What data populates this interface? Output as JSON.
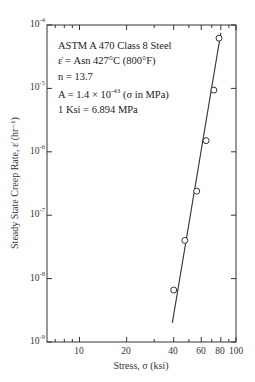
{
  "chart_data": {
    "type": "scatter",
    "title": "",
    "xlabel": "Stress, σ (ksi)",
    "ylabel": "Steady State Creep Rate, ε̇ (hr⁻¹)",
    "xscale": "log",
    "yscale": "log",
    "xlim": [
      6.2,
      100
    ],
    "ylim": [
      1e-09,
      0.0001
    ],
    "x_ticks": [
      "10",
      "20",
      "40",
      "60",
      "80",
      "100"
    ],
    "y_ticks": [
      "10-4",
      "10-5",
      "10-6",
      "10-7",
      "10-8",
      "10-9"
    ],
    "grid": false,
    "series": [
      {
        "name": "Measured",
        "marker": "open-circle",
        "x": [
          40.0,
          47.1,
          56.1,
          64.4,
          72.2,
          77.9
        ],
        "y": [
          6.6e-09,
          4e-08,
          2.4e-07,
          1.5e-06,
          9.4e-06,
          6.2e-05
        ]
      },
      {
        "name": "Power-law fit",
        "style": "line",
        "x": [
          39.2,
          80.0
        ],
        "y": [
          2e-09,
          7.5e-05
        ]
      }
    ],
    "annotations": [
      "ASTM A 470 Class 8 Steel",
      "ε̇ = Asn   427°C (800°F)",
      "n = 13.7",
      "A = 1.4 × 10^-43 (σ in MPa)",
      "1 Ksi = 6.894 MPa"
    ]
  },
  "labels": {
    "x_title": "Stress, σ (ksi)",
    "y_title": "Steady State Creep Rate, ε̇ (hr⁻¹)",
    "y_ticks": [
      {
        "base": "10",
        "exp": "-4"
      },
      {
        "base": "10",
        "exp": "-5"
      },
      {
        "base": "10",
        "exp": "-6"
      },
      {
        "base": "10",
        "exp": "-7"
      },
      {
        "base": "10",
        "exp": "-8"
      },
      {
        "base": "10",
        "exp": "-9"
      }
    ],
    "x_ticks": [
      "10",
      "20",
      "40",
      "60",
      "80",
      "100"
    ],
    "annot": {
      "line1": "ASTM A 470 Class 8 Steel",
      "line2": "ε̇ = Asn   427°C (800°F)",
      "line3": "n = 13.7",
      "line4_pre": "A = ",
      "line4_mant": "1.4 × 10",
      "line4_exp": "-43",
      "line4_post": " (σ in MPa)",
      "line5": "1 Ksi = 6.894 MPa"
    }
  },
  "colors": {
    "ink": "#333333",
    "background": "#ffffff"
  }
}
